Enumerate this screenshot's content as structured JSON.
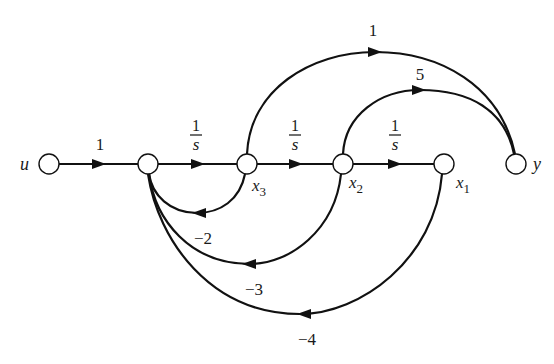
{
  "diagram": {
    "type": "signal-flow-graph",
    "nodes": [
      {
        "id": "u",
        "label": "u",
        "x": 49,
        "y": 164
      },
      {
        "id": "n1",
        "label": "",
        "x": 148,
        "y": 164
      },
      {
        "id": "x3",
        "label": "x",
        "sub": "3",
        "x": 247,
        "y": 164
      },
      {
        "id": "x2",
        "label": "x",
        "sub": "2",
        "x": 343,
        "y": 164
      },
      {
        "id": "x1",
        "label": "x",
        "sub": "1",
        "x": 444,
        "y": 164
      },
      {
        "id": "y",
        "label": "y",
        "x": 516,
        "y": 164
      }
    ],
    "edges": [
      {
        "from": "u",
        "to": "n1",
        "gain": "1"
      },
      {
        "from": "n1",
        "to": "x3",
        "gain_num": "1",
        "gain_den": "s"
      },
      {
        "from": "x3",
        "to": "x2",
        "gain_num": "1",
        "gain_den": "s"
      },
      {
        "from": "x2",
        "to": "x1",
        "gain_num": "1",
        "gain_den": "s"
      },
      {
        "from": "x3",
        "to": "y",
        "gain": "1"
      },
      {
        "from": "x2",
        "to": "y",
        "gain": "5"
      },
      {
        "from": "x3",
        "to": "n1",
        "gain": "−2"
      },
      {
        "from": "x2",
        "to": "n1",
        "gain": "−3"
      },
      {
        "from": "x1",
        "to": "n1",
        "gain": "−4"
      }
    ]
  },
  "labels": {
    "u": "u",
    "y": "y",
    "x": "x",
    "x3_sub": "3",
    "x2_sub": "2",
    "x1_sub": "1",
    "gain_u_n1": "1",
    "frac_num": "1",
    "frac_den": "s",
    "gain_x3_y": "1",
    "gain_x2_y": "5",
    "gain_fb_x3": "−2",
    "gain_fb_x2": "−3",
    "gain_fb_x1": "−4"
  }
}
